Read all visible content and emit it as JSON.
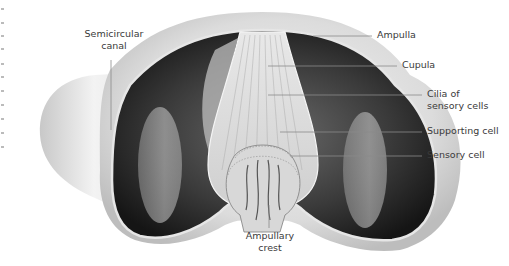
{
  "figure": {
    "labels": {
      "semicircular_canal": [
        "Semicircular",
        "canal"
      ],
      "ampulla": "Ampulla",
      "cupula": "Cupula",
      "cilia": [
        "Cilia of",
        "sensory cells"
      ],
      "supporting_cell": "Supporting cell",
      "sensory_cell": "Sensory cell",
      "ampullary_crest": [
        "Ampullary",
        "crest"
      ]
    },
    "colors": {
      "background": "#ffffff",
      "outer_wall": "#d9d9d9",
      "lumen_dark": "#2b2b2b",
      "leader_line": "#8a8a8a",
      "label_text": "#3a3a3a"
    }
  }
}
